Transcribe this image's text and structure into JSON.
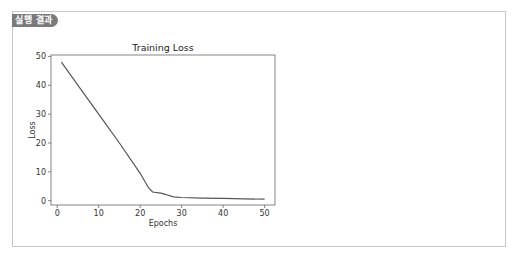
{
  "result_panel": {
    "badge_label": "실행 결과"
  },
  "colors": {
    "badge_bg": "#7a7a7a",
    "line": "#555555",
    "axis": "#666666",
    "border": "#c8c8c8"
  },
  "chart_data": {
    "type": "line",
    "title": "Training Loss",
    "xlabel": "Epochs",
    "ylabel": "Loss",
    "xlim": [
      -1.5,
      52.5
    ],
    "ylim": [
      -1.5,
      50.5
    ],
    "xticks": [
      0,
      10,
      20,
      30,
      40,
      50
    ],
    "yticks": [
      0,
      10,
      20,
      30,
      40,
      50
    ],
    "grid": false,
    "legend": null,
    "series": [
      {
        "name": "loss",
        "x": [
          1,
          5,
          10,
          15,
          20,
          21,
          22,
          23,
          25,
          26,
          28,
          30,
          35,
          40,
          45,
          50
        ],
        "values": [
          48,
          40,
          30,
          20,
          9.5,
          7,
          4.5,
          3,
          2.6,
          2.2,
          1.3,
          1.1,
          0.9,
          0.8,
          0.65,
          0.5
        ]
      }
    ]
  }
}
